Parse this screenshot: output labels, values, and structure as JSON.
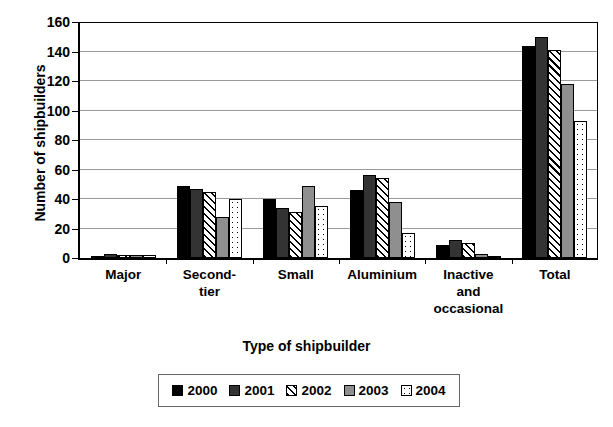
{
  "chart_data": {
    "type": "bar",
    "title": "",
    "subtitle": "",
    "xlabel": "Type of shipbuilder",
    "ylabel": "Number of shipbuilders",
    "ylim": [
      0,
      160
    ],
    "ytick_step": 20,
    "yticks": [
      160,
      140,
      120,
      100,
      80,
      60,
      40,
      20,
      0
    ],
    "grid": "horizontal",
    "legend_position": "bottom",
    "categories": [
      "Major",
      "Second-tier",
      "Small",
      "Aluminium",
      "Inactive and occasional",
      "Total"
    ],
    "category_label_lines": [
      [
        "Major"
      ],
      [
        "Second-",
        "tier"
      ],
      [
        "Small"
      ],
      [
        "Aluminium"
      ],
      [
        "Inactive",
        "and",
        "occasional"
      ],
      [
        "Total"
      ]
    ],
    "series": [
      {
        "name": "2000",
        "fill": "solid-black",
        "color": "#000000",
        "values": [
          1,
          49,
          40,
          46,
          9,
          144
        ]
      },
      {
        "name": "2001",
        "fill": "solid-darkgray",
        "color": "#333333",
        "values": [
          3,
          47,
          34,
          56,
          12,
          150
        ]
      },
      {
        "name": "2002",
        "fill": "diagonal-hatch",
        "color": "#000000",
        "values": [
          2,
          45,
          31,
          54,
          10,
          141
        ]
      },
      {
        "name": "2003",
        "fill": "solid-gray",
        "color": "#8f8f8f",
        "values": [
          2,
          28,
          49,
          38,
          3,
          118
        ]
      },
      {
        "name": "2004",
        "fill": "dotted-white",
        "color": "#ffffff",
        "values": [
          2,
          40,
          35,
          17,
          1,
          93
        ]
      }
    ]
  },
  "legend": {
    "entries": [
      {
        "label": "2000"
      },
      {
        "label": "2001"
      },
      {
        "label": "2002"
      },
      {
        "label": "2003"
      },
      {
        "label": "2004"
      }
    ]
  }
}
